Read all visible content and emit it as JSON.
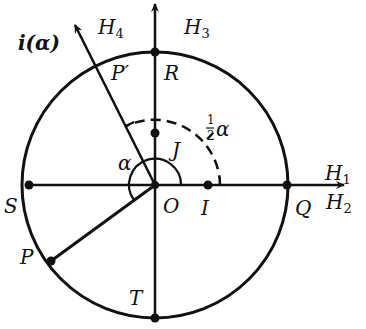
{
  "figure": {
    "type": "geometric-diagram",
    "colors": {
      "ink": "#111111",
      "background": "#ffffff"
    },
    "circle": {
      "center_label": "O",
      "radius_label": ""
    },
    "points": {
      "O": "O",
      "I": "I",
      "J": "J",
      "P": "P",
      "P_prime": "P′",
      "Q": "Q",
      "R": "R",
      "S": "S",
      "T": "T"
    },
    "rays": {
      "i_alpha": "i(α)",
      "H1": {
        "script": "H",
        "sub": "1"
      },
      "H2": {
        "script": "H",
        "sub": "2"
      },
      "H3": {
        "script": "H",
        "sub": "3"
      },
      "H4": {
        "script": "H",
        "sub": "4"
      }
    },
    "angles": {
      "alpha": "α",
      "half_alpha_num": "1",
      "half_alpha_den": "2",
      "half_alpha_sym": "α"
    }
  }
}
